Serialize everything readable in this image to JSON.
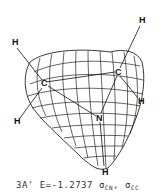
{
  "figure": {
    "type": "molecular-orbital-surface",
    "atoms": [
      {
        "label": "H",
        "x": 15,
        "y": 45
      },
      {
        "label": "C",
        "x": 44,
        "y": 85
      },
      {
        "label": "H",
        "x": 17,
        "y": 123
      },
      {
        "label": "H",
        "x": 142,
        "y": 22
      },
      {
        "label": "C",
        "x": 118,
        "y": 74
      },
      {
        "label": "H",
        "x": 141,
        "y": 103
      },
      {
        "label": "N",
        "x": 99,
        "y": 120
      },
      {
        "label": "H",
        "x": 105,
        "y": 173
      }
    ]
  },
  "caption": {
    "state": "3A'",
    "energy": "E=-1.2737",
    "orbital1": "σ",
    "orbital1_sub": "CN",
    "sep": ",",
    "orbital2": "σ",
    "orbital2_sub": "CC"
  }
}
